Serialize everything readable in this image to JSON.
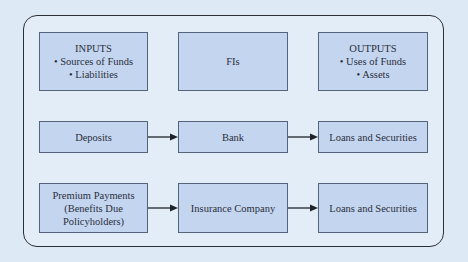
{
  "diagram": {
    "header_row": {
      "inputs": {
        "title": "INPUTS",
        "bullets": [
          "• Sources of Funds",
          "• Liabilities"
        ]
      },
      "middle": {
        "title": "FIs"
      },
      "outputs": {
        "title": "OUTPUTS",
        "bullets": [
          "• Uses of Funds",
          "• Assets"
        ]
      }
    },
    "bank_row": {
      "input": "Deposits",
      "institution": "Bank",
      "output": "Loans and Securities"
    },
    "insurance_row": {
      "input_lines": [
        "Premium Payments",
        "(Benefits Due",
        "Policyholders)"
      ],
      "institution": "Insurance Company",
      "output": "Loans and Securities"
    },
    "colors": {
      "background": "#dde9f4",
      "box_fill": "#c4d5f0",
      "box_border": "#55647a",
      "frame_border": "#2b2f36",
      "arrow": "#1f2329"
    }
  }
}
